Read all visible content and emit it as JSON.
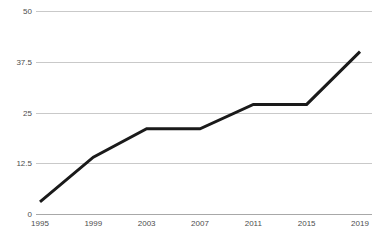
{
  "chart_data": {
    "type": "line",
    "title": "",
    "subtitle": "",
    "xlabel": "",
    "ylabel": "",
    "categories": [
      "1995",
      "1999",
      "2003",
      "2007",
      "2011",
      "2015",
      "2019"
    ],
    "x": [
      1995,
      1999,
      2003,
      2007,
      2011,
      2015,
      2019
    ],
    "values": [
      3,
      14,
      21,
      21,
      27,
      27,
      40
    ],
    "series": [
      {
        "name": "",
        "values": [
          3,
          14,
          21,
          21,
          27,
          27,
          40
        ],
        "color": "#1a1a1a"
      }
    ],
    "xlim": [
      1995,
      2019
    ],
    "ylim": [
      0,
      50
    ],
    "y_ticks": [
      "0",
      "12.5",
      "25",
      "37.5",
      "50"
    ],
    "y_tick_values": [
      0,
      12.5,
      25,
      37.5,
      50
    ],
    "x_ticks": [
      "1995",
      "1999",
      "2003",
      "2007",
      "2011",
      "2015",
      "2019"
    ],
    "grid": true,
    "grid_axis": "y",
    "legend": false,
    "legend_position": "none",
    "annotations": []
  },
  "style": {
    "background": "#ffffff",
    "line_color": "#1a1a1a",
    "gridline_color": "#c9c9c9",
    "axis_color": "#a8a8a8",
    "tick_label_color": "#4d4d4d"
  }
}
